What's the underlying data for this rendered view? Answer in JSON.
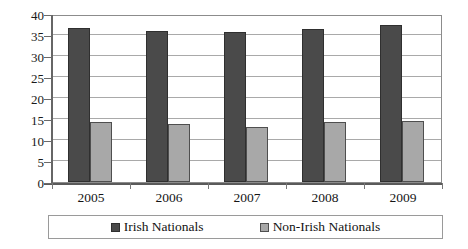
{
  "chart_data": {
    "type": "bar",
    "title": "",
    "subtitle": "",
    "xlabel": "",
    "ylabel": "",
    "categories": [
      "2005",
      "2006",
      "2007",
      "2008",
      "2009"
    ],
    "series": [
      {
        "name": "Irish Nationals",
        "color": "#4a4a4a",
        "values": [
          36.6,
          35.9,
          35.7,
          36.4,
          37.3
        ]
      },
      {
        "name": "Non-Irish Nationals",
        "color": "#a8a8a8",
        "values": [
          14.2,
          13.9,
          13.1,
          14.4,
          14.6
        ]
      }
    ],
    "ylim": [
      0,
      40
    ],
    "ytick_step": 5,
    "ytick_labels": [
      "40",
      "35",
      "30",
      "25",
      "20",
      "15",
      "10",
      "5",
      "0"
    ],
    "grid": true,
    "grid_axis": "y",
    "legend_position": "bottom",
    "legend_orientation": "horizontal",
    "plot_border": true,
    "plot_background": "#ffffff"
  },
  "legend": {
    "entries": [
      {
        "label": "Irish Nationals",
        "swatch_color": "#4a4a4a"
      },
      {
        "label": "Non-Irish Nationals",
        "swatch_color": "#a8a8a8"
      }
    ]
  }
}
